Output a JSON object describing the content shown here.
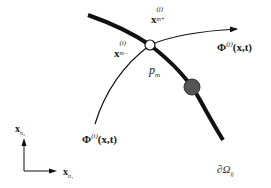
{
  "diagram": {
    "type": "trajectory-boundary-crossing",
    "labels": {
      "x_m_plus": {
        "base": "x",
        "sup": "(j)",
        "sub": "m+"
      },
      "x_m_minus": {
        "base": "x",
        "sup": "(i)",
        "sub": "m−"
      },
      "phi_j": {
        "base": "Φ",
        "sup": "(j)",
        "args": "(x,t)"
      },
      "phi_i": {
        "base": "Φ",
        "sup": "(i)",
        "args": "(x,t)"
      },
      "p_m": {
        "base": "p",
        "sub": "m"
      },
      "axis_y": {
        "base": "x",
        "sub": "n₂"
      },
      "axis_x": {
        "base": "x",
        "sub": "n₁"
      },
      "boundary": {
        "base": "∂Ω",
        "sub": "ij"
      }
    },
    "colors": {
      "stroke": "#111111",
      "open_node_fill": "#ffffff",
      "filled_node_fill": "#555555",
      "background": "#ffffff"
    }
  }
}
